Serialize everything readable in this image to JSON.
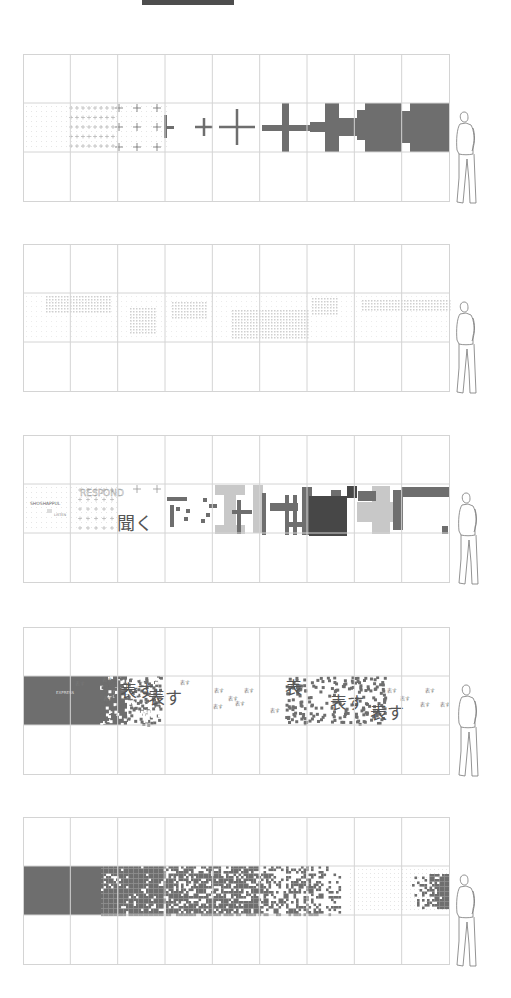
{
  "diagram": {
    "type": "elevation-sequence",
    "grid": {
      "x0": 23,
      "x1": 449,
      "columns": 9,
      "row_height": 49
    },
    "colors": {
      "grid_line": "#d4d4d4",
      "dot_grid": "#e6e6e6",
      "fill_dark": "#6e6e6e",
      "fill_darker": "#474747",
      "fill_light": "#c8c8c8",
      "topbar": "#4d4d4d"
    },
    "panels": [
      {
        "id": "panel-1",
        "top": 54,
        "description": "crosses grow from small plus signs into solid blocks",
        "crosses": [
          {
            "x": 119,
            "y": 108,
            "s": 4
          },
          {
            "x": 137,
            "y": 108,
            "s": 4
          },
          {
            "x": 157,
            "y": 108,
            "s": 4
          },
          {
            "x": 119,
            "y": 127,
            "s": 4
          },
          {
            "x": 137,
            "y": 127,
            "s": 4
          },
          {
            "x": 157,
            "y": 127,
            "s": 4
          },
          {
            "x": 119,
            "y": 147,
            "s": 4
          },
          {
            "x": 137,
            "y": 147,
            "s": 4
          },
          {
            "x": 157,
            "y": 147,
            "s": 4
          },
          {
            "x": 204,
            "y": 127,
            "s": 9
          },
          {
            "x": 237,
            "y": 127,
            "s": 18
          }
        ],
        "blocks": [
          [
            164,
            115,
            3,
            23
          ],
          [
            164,
            126,
            10,
            3
          ],
          [
            262,
            125,
            58,
            6
          ],
          [
            282,
            103,
            7,
            49
          ],
          [
            310,
            122,
            40,
            10
          ],
          [
            325,
            103,
            14,
            49
          ],
          [
            338,
            118,
            20,
            18
          ],
          [
            357,
            110,
            60,
            30
          ],
          [
            365,
            103,
            28,
            49
          ],
          [
            393,
            103,
            56,
            49
          ],
          [
            402,
            103,
            8,
            8
          ],
          [
            402,
            143,
            8,
            9
          ]
        ],
        "figure_x": 455
      },
      {
        "id": "panel-2",
        "top": 244,
        "description": "faint dot-grid patterns in band",
        "patches": [
          [
            46,
            296,
            64,
            18
          ],
          [
            130,
            308,
            26,
            26
          ],
          [
            172,
            302,
            36,
            16
          ],
          [
            232,
            310,
            76,
            30
          ],
          [
            312,
            298,
            26,
            16
          ],
          [
            362,
            300,
            90,
            12
          ]
        ],
        "figure_x": 455
      },
      {
        "id": "panel-3",
        "top": 435,
        "description": "text LISTEN/RESPOND transforms into pixel blocks",
        "labels": {
          "label_a": "SHOSHAPPUL",
          "label_b": "LISTEN",
          "label_c": "RESPOND",
          "kanji": "聞く"
        },
        "blocks_dark": [
          [
            167,
            497,
            20,
            4
          ],
          [
            170,
            505,
            4,
            22
          ],
          [
            176,
            507,
            4,
            4
          ],
          [
            186,
            509,
            4,
            4
          ],
          [
            184,
            517,
            4,
            4
          ],
          [
            203,
            498,
            4,
            4
          ],
          [
            209,
            504,
            8,
            4
          ],
          [
            201,
            519,
            4,
            4
          ],
          [
            206,
            513,
            4,
            4
          ],
          [
            232,
            510,
            20,
            4
          ],
          [
            237,
            500,
            4,
            34
          ],
          [
            262,
            493,
            4,
            42
          ],
          [
            270,
            503,
            28,
            8
          ],
          [
            285,
            495,
            4,
            40
          ],
          [
            293,
            495,
            4,
            40
          ],
          [
            286,
            522,
            18,
            5
          ],
          [
            302,
            487,
            10,
            48
          ],
          [
            331,
            490,
            10,
            10
          ],
          [
            358,
            491,
            18,
            10
          ],
          [
            393,
            490,
            10,
            40
          ],
          [
            401,
            487,
            48,
            10
          ],
          [
            442,
            526,
            6,
            8
          ]
        ],
        "blocks_darker": [
          [
            309,
            496,
            38,
            40
          ],
          [
            347,
            486,
            10,
            12
          ]
        ],
        "blocks_light": [
          [
            215,
            485,
            30,
            10
          ],
          [
            215,
            525,
            30,
            9
          ],
          [
            224,
            485,
            12,
            48
          ],
          [
            253,
            485,
            10,
            48
          ],
          [
            357,
            502,
            44,
            20
          ],
          [
            372,
            486,
            18,
            48
          ]
        ],
        "figure_x": 457
      },
      {
        "id": "panel-4",
        "top": 627,
        "description": "EXPRESS / 表す text dissolving",
        "labels": {
          "express": "EXPRESS",
          "kanji": "表す",
          "small": "表す"
        },
        "solid_rect": [
          23,
          676,
          104,
          49
        ],
        "figure_x": 457
      },
      {
        "id": "panel-5",
        "top": 817,
        "description": "solid mass dissolves into scattered pixels",
        "solid_rect": [
          23,
          866,
          78,
          49
        ],
        "right_cluster": [
          412,
          874,
          37,
          34
        ],
        "figure_x": 455
      }
    ]
  }
}
